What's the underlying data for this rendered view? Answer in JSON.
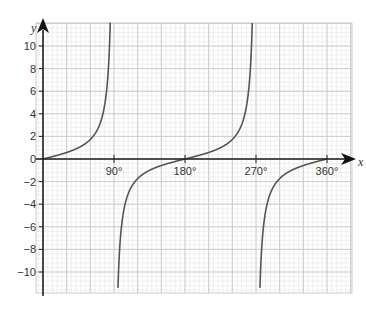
{
  "chart_data": {
    "type": "line",
    "title": "",
    "function": "y = tan x",
    "xlabel": "x",
    "ylabel": "y",
    "xlim": [
      0,
      395
    ],
    "ylim": [
      -12,
      12
    ],
    "grid": true,
    "x_ticks": [
      {
        "value": 90,
        "label": "90°"
      },
      {
        "value": 180,
        "label": "180°"
      },
      {
        "value": 270,
        "label": "270°"
      },
      {
        "value": 360,
        "label": "360°"
      }
    ],
    "y_ticks": [
      {
        "value": 10,
        "label": "10"
      },
      {
        "value": 8,
        "label": "8"
      },
      {
        "value": 6,
        "label": "6"
      },
      {
        "value": 4,
        "label": "4"
      },
      {
        "value": 2,
        "label": "2"
      },
      {
        "value": 0,
        "label": "0"
      },
      {
        "value": -2,
        "label": "−2"
      },
      {
        "value": -4,
        "label": "−4"
      },
      {
        "value": -6,
        "label": "−6"
      },
      {
        "value": -8,
        "label": "−8"
      },
      {
        "value": -10,
        "label": "−10"
      }
    ],
    "asymptotes_x": [
      90,
      270
    ],
    "zeros_x": [
      0,
      180,
      360
    ],
    "series": [
      {
        "name": "tan x",
        "x": [
          0,
          45,
          60,
          75,
          85,
          89
        ],
        "y": [
          0,
          1,
          1.73,
          3.73,
          11.43,
          57.3
        ]
      },
      {
        "name": "tan x",
        "x": [
          91,
          95,
          105,
          120,
          135,
          180,
          225,
          240,
          255,
          265,
          269
        ],
        "y": [
          -57.3,
          -11.43,
          -3.73,
          -1.73,
          -1,
          0,
          1,
          1.73,
          3.73,
          11.43,
          57.3
        ]
      },
      {
        "name": "tan x",
        "x": [
          271,
          275,
          285,
          300,
          315,
          360
        ],
        "y": [
          -57.3,
          -11.43,
          -3.73,
          -1.73,
          -1,
          0
        ]
      }
    ],
    "colors": {
      "curve": "#555555",
      "axis": "#222222",
      "grid_major": "#c8c8c8",
      "grid_minor": "#e6e6e6"
    }
  }
}
